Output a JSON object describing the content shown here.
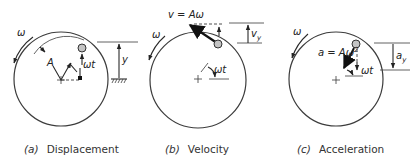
{
  "figure": {
    "panels": [
      {
        "id": "a",
        "caption_letter": "(a)",
        "caption_text": "Displacement",
        "labels": {
          "omega": "ω",
          "amplitude": "A",
          "angle": "ωt",
          "projection": "y"
        }
      },
      {
        "id": "b",
        "caption_letter": "(b)",
        "caption_text": "Velocity",
        "labels": {
          "omega": "ω",
          "vector": "v = Aω",
          "angle": "ωt",
          "projection": "v",
          "projection_sub": "y"
        }
      },
      {
        "id": "c",
        "caption_letter": "(c)",
        "caption_text": "Acceleration",
        "labels": {
          "omega": "ω",
          "vector": "a = Aω",
          "vector_sup": "2",
          "angle": "ωt",
          "projection": "a",
          "projection_sub": "y"
        }
      }
    ]
  }
}
